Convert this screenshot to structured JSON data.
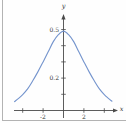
{
  "figure": {
    "background": "#fefefe",
    "frame_color": "#b3b3b3"
  },
  "chart_data": {
    "type": "line",
    "title": "",
    "xlabel": "x",
    "ylabel": "y",
    "xlim": [
      -4.9,
      5.2
    ],
    "ylim": [
      0,
      0.58
    ],
    "grid": false,
    "legend": "none",
    "axis_color": "#4a4a4a",
    "curve_color": "#7494cd",
    "x_ticks": [
      -4,
      -2,
      2,
      4
    ],
    "x_tick_labels": [
      {
        "value": -2,
        "text": "-2"
      },
      {
        "value": 2,
        "text": "2"
      }
    ],
    "y_ticks": [
      0.1,
      0.2,
      0.3,
      0.4,
      0.5
    ],
    "y_tick_labels": [
      {
        "value": 0.5,
        "text": "0.5"
      },
      {
        "value": 0.2,
        "text": "0.2"
      }
    ],
    "series": [
      {
        "name": "bell-curve",
        "points": [
          [
            -4.8,
            0.055
          ],
          [
            -4.4,
            0.075
          ],
          [
            -4.0,
            0.098
          ],
          [
            -3.5,
            0.135
          ],
          [
            -3.0,
            0.185
          ],
          [
            -2.5,
            0.24
          ],
          [
            -2.0,
            0.3
          ],
          [
            -1.5,
            0.362
          ],
          [
            -1.0,
            0.425
          ],
          [
            -0.5,
            0.468
          ],
          [
            0.0,
            0.49
          ],
          [
            0.5,
            0.468
          ],
          [
            1.0,
            0.425
          ],
          [
            1.5,
            0.362
          ],
          [
            2.0,
            0.3
          ],
          [
            2.5,
            0.24
          ],
          [
            3.0,
            0.185
          ],
          [
            3.5,
            0.135
          ],
          [
            4.0,
            0.098
          ],
          [
            4.4,
            0.075
          ],
          [
            4.75,
            0.057
          ]
        ]
      }
    ]
  }
}
